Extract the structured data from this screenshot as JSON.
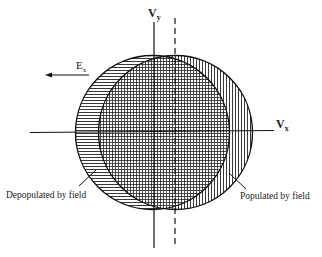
{
  "diagram": {
    "axes": {
      "vertical_label": "V",
      "vertical_subscript": "y",
      "horizontal_label": "V",
      "horizontal_subscript": "x"
    },
    "field": {
      "label": "E",
      "subscript": "x",
      "direction": "left"
    },
    "regions": {
      "depopulated": "Depopulated by field",
      "populated": "Populated by field",
      "overlap": "unchanged (crosshatched)"
    },
    "colors": {
      "ink": "#1a1a1a",
      "background": "#ffffff"
    }
  }
}
